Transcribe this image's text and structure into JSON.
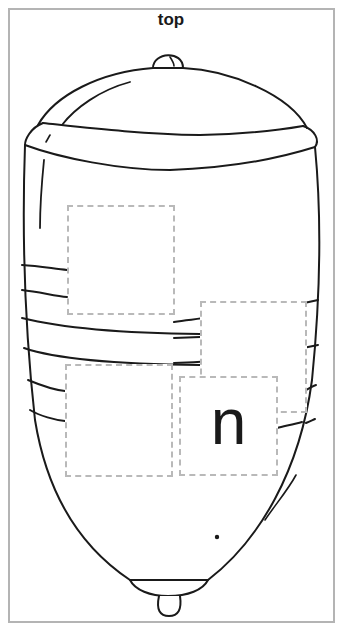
{
  "worksheet": {
    "title": "top",
    "image_subject": "spinning-top",
    "letter_boxes": [
      {
        "id": "box-1",
        "letter": ""
      },
      {
        "id": "box-2",
        "letter": ""
      },
      {
        "id": "box-3",
        "letter": ""
      },
      {
        "id": "box-4",
        "letter": "n"
      }
    ],
    "colors": {
      "border": "#b4b4b4",
      "dashed_box": "#b9b9b9",
      "ink": "#1a1a1a"
    }
  }
}
